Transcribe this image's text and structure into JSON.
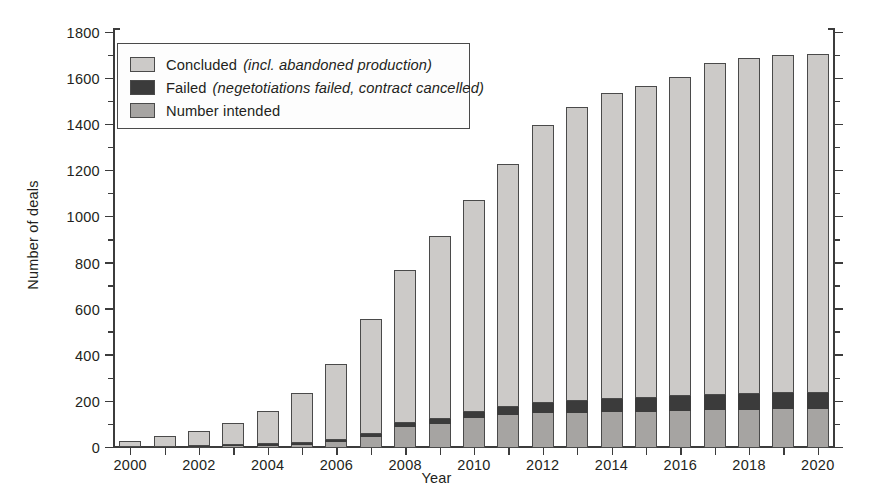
{
  "chart_data": {
    "type": "bar",
    "stacked": true,
    "title": "",
    "xlabel": "Year",
    "ylabel": "Number of deals",
    "ylim": [
      0,
      1800
    ],
    "ytick_step": 200,
    "yminor_step": 100,
    "grid": false,
    "legend_position": "upper-left",
    "categories": [
      "2000",
      "2001",
      "2002",
      "2003",
      "2004",
      "2005",
      "2006",
      "2007",
      "2008",
      "2009",
      "2010",
      "2011",
      "2012",
      "2013",
      "2014",
      "2015",
      "2016",
      "2017",
      "2018",
      "2019",
      "2020"
    ],
    "xtick_labels": [
      "2000",
      "2002",
      "2004",
      "2006",
      "2008",
      "2010",
      "2012",
      "2014",
      "2016",
      "2018",
      "2020"
    ],
    "ytick_labels": [
      "0",
      "200",
      "400",
      "600",
      "800",
      "1000",
      "1200",
      "1400",
      "1600",
      "1800"
    ],
    "series": [
      {
        "name": "Number intended",
        "color": "#a6a4a2",
        "order": 0,
        "values": [
          3,
          4,
          6,
          8,
          10,
          14,
          26,
          46,
          90,
          105,
          130,
          145,
          150,
          152,
          155,
          157,
          160,
          163,
          166,
          168,
          170
        ]
      },
      {
        "name": "Failed",
        "color": "#3b3b3b",
        "order": 1,
        "values": [
          1,
          2,
          3,
          5,
          6,
          8,
          10,
          14,
          18,
          22,
          28,
          35,
          45,
          52,
          58,
          62,
          64,
          66,
          68,
          70,
          70
        ]
      },
      {
        "name": "Concluded",
        "color": "#cccac8",
        "order": 2,
        "values": [
          26,
          44,
          66,
          97,
          144,
          218,
          328,
          500,
          662,
          793,
          917,
          1050,
          1205,
          1276,
          1327,
          1351,
          1386,
          1441,
          1456,
          1467,
          1470
        ]
      }
    ],
    "totals": [
      30,
      50,
      75,
      110,
      160,
      240,
      364,
      560,
      770,
      920,
      1075,
      1230,
      1400,
      1480,
      1540,
      1570,
      1610,
      1670,
      1690,
      1705,
      1710
    ]
  },
  "legend": {
    "items": [
      {
        "swatch": "sw-concluded",
        "label": "Concluded",
        "note": "(incl. abandoned production)"
      },
      {
        "swatch": "sw-failed",
        "label": "Failed",
        "note": "(negetotiations failed, contract cancelled)"
      },
      {
        "swatch": "sw-intended",
        "label": "Number intended",
        "note": ""
      }
    ]
  }
}
